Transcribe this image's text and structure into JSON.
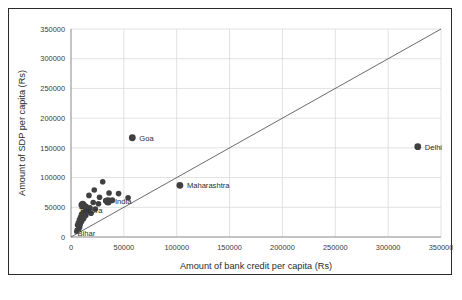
{
  "chart_data": {
    "type": "scatter",
    "title": "",
    "xlabel": "Amount of bank credit per capita (Rs)",
    "ylabel": "Amount of SDP per capita (Rs)",
    "xlim": [
      0,
      350000
    ],
    "ylim": [
      0,
      350000
    ],
    "xticks": [
      0,
      50000,
      100000,
      150000,
      200000,
      250000,
      300000,
      350000
    ],
    "yticks": [
      0,
      50000,
      100000,
      150000,
      200000,
      250000,
      300000,
      350000
    ],
    "xtick_labels": [
      "0",
      "50000",
      "100000",
      "150000",
      "200000",
      "250000",
      "300000",
      "350000"
    ],
    "ytick_labels": [
      "0",
      "50000",
      "100000",
      "150000",
      "200000",
      "250000",
      "300000",
      "350000"
    ],
    "grid": true,
    "grid_color": "#d9d9d9",
    "legend": "none",
    "marker_color": "#404040",
    "reference_line": {
      "name": "y = x identity line",
      "from": [
        0,
        0
      ],
      "to": [
        350000,
        350000
      ],
      "color": "#595959"
    },
    "points": [
      {
        "label": "Goa",
        "x": 58000,
        "y": 167000,
        "r": 3.4,
        "labeled": true
      },
      {
        "label": "Delhi",
        "x": 328000,
        "y": 152000,
        "r": 3.4,
        "labeled": true
      },
      {
        "label": "Maharashtra",
        "x": 103000,
        "y": 87000,
        "r": 3.4,
        "labeled": true
      },
      {
        "label": "India",
        "x": 35000,
        "y": 60000,
        "r": 4.2,
        "labeled": true
      },
      {
        "label": "Tripura",
        "x": 11000,
        "y": 54000,
        "r": 4.2,
        "labeled": true
      },
      {
        "label": "Bihar",
        "x": 8000,
        "y": 17000,
        "r": 3.0,
        "labeled": true
      },
      {
        "label": "",
        "x": 30000,
        "y": 93000,
        "r": 2.8,
        "labeled": false
      },
      {
        "label": "",
        "x": 22000,
        "y": 79000,
        "r": 2.8,
        "labeled": false
      },
      {
        "label": "",
        "x": 36000,
        "y": 74000,
        "r": 2.8,
        "labeled": false
      },
      {
        "label": "",
        "x": 45000,
        "y": 73000,
        "r": 2.8,
        "labeled": false
      },
      {
        "label": "",
        "x": 17000,
        "y": 70000,
        "r": 2.8,
        "labeled": false
      },
      {
        "label": "",
        "x": 27000,
        "y": 67000,
        "r": 2.8,
        "labeled": false
      },
      {
        "label": "",
        "x": 54000,
        "y": 66000,
        "r": 2.8,
        "labeled": false
      },
      {
        "label": "",
        "x": 39000,
        "y": 62000,
        "r": 3.0,
        "labeled": false
      },
      {
        "label": "",
        "x": 33000,
        "y": 61000,
        "r": 3.0,
        "labeled": false
      },
      {
        "label": "",
        "x": 21000,
        "y": 58000,
        "r": 2.8,
        "labeled": false
      },
      {
        "label": "",
        "x": 26000,
        "y": 56000,
        "r": 2.8,
        "labeled": false
      },
      {
        "label": "",
        "x": 14000,
        "y": 51000,
        "r": 3.2,
        "labeled": false
      },
      {
        "label": "",
        "x": 18000,
        "y": 49000,
        "r": 2.8,
        "labeled": false
      },
      {
        "label": "",
        "x": 23000,
        "y": 47000,
        "r": 2.8,
        "labeled": false
      },
      {
        "label": "",
        "x": 16000,
        "y": 44000,
        "r": 2.8,
        "labeled": false
      },
      {
        "label": "",
        "x": 12000,
        "y": 42000,
        "r": 2.8,
        "labeled": false
      },
      {
        "label": "",
        "x": 19000,
        "y": 40000,
        "r": 2.8,
        "labeled": false
      },
      {
        "label": "",
        "x": 10000,
        "y": 38000,
        "r": 2.8,
        "labeled": false
      },
      {
        "label": "",
        "x": 14000,
        "y": 36000,
        "r": 2.8,
        "labeled": false
      },
      {
        "label": "",
        "x": 9000,
        "y": 33000,
        "r": 2.8,
        "labeled": false
      },
      {
        "label": "",
        "x": 12000,
        "y": 31000,
        "r": 2.8,
        "labeled": false
      },
      {
        "label": "",
        "x": 8000,
        "y": 29000,
        "r": 2.8,
        "labeled": false
      },
      {
        "label": "",
        "x": 10000,
        "y": 26000,
        "r": 2.8,
        "labeled": false
      },
      {
        "label": "",
        "x": 7000,
        "y": 24000,
        "r": 2.8,
        "labeled": false
      },
      {
        "label": "",
        "x": 9000,
        "y": 22000,
        "r": 2.6,
        "labeled": false
      },
      {
        "label": "",
        "x": 6000,
        "y": 20000,
        "r": 2.6,
        "labeled": false
      },
      {
        "label": "",
        "x": 7500,
        "y": 14000,
        "r": 2.6,
        "labeled": false
      },
      {
        "label": "",
        "x": 5500,
        "y": 12000,
        "r": 2.4,
        "labeled": false
      },
      {
        "label": "",
        "x": 5000,
        "y": 9000,
        "r": 2.4,
        "labeled": false
      }
    ]
  }
}
